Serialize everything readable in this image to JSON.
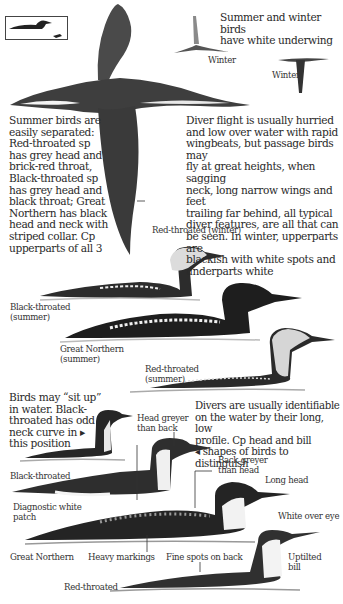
{
  "page": {
    "type": "field guide illustration page"
  },
  "inset": {
    "icon": "size-comparison-icon",
    "description": "diver silhouette vs small bird silhouette"
  },
  "top_caption": "Summer and winter birds\nhave white underwing",
  "flight_labels": {
    "winter_1": "Winter",
    "winter_2": "Winter"
  },
  "summer_text": "Summer birds are\neasily separated:\nRed-throated sp\nhas grey head and\nbrick-red throat,\nBlack-throated sp\nhas grey head and\nblack throat; Great\nNorthern has black\nhead and neck with\nstriped collar. Cp\nupperparts of all 3",
  "flight_text": "Diver flight is usually hurried\nand low over water with rapid\nwingbeats, but passage birds may\nfly at great heights, when sagging\nneck, long narrow wings and feet\ntrailing far behind, all typical\ndiver features, are all that can\nbe seen. In winter, upperparts are\nblackish with white spots and\nunderparts white",
  "flying_bird_label": "Red-throated (winter)",
  "summer_birds": [
    {
      "label": "Black-throated\n(summer)"
    },
    {
      "label": "Great Northern\n(summer)"
    },
    {
      "label": "Red-throated\n(summer)"
    }
  ],
  "sit_up_text": "Birds may “sit up”\nin water. Black-\nthroated has odd\nneck curve in ▸\nthis position",
  "water_text": "Divers are usually identifiable\non the water by their long, low\nprofile. Cp head and bill\n◂ shapes of birds to distinguish",
  "winter_birds": {
    "black_throated": "Black-throated",
    "great_northern": "Great Northern",
    "red_throated": "Red-throated"
  },
  "annotations": {
    "head_greyer": "Head greyer\nthan back",
    "back_greyer": "Back greyer\nthan head",
    "long_head": "Long head",
    "white_over_eye": "White over eye",
    "diagnostic_patch": "Diagnostic white\npatch",
    "heavy_markings": "Heavy markings",
    "fine_spots": "Fine spots on back",
    "uptilted_bill": "Uptilted\nbill"
  },
  "colors": {
    "background": "#ffffff",
    "ink": "#2a2a2a",
    "grey_head": "#d8d8d8",
    "dark_plumage": "#1e1e1e"
  }
}
